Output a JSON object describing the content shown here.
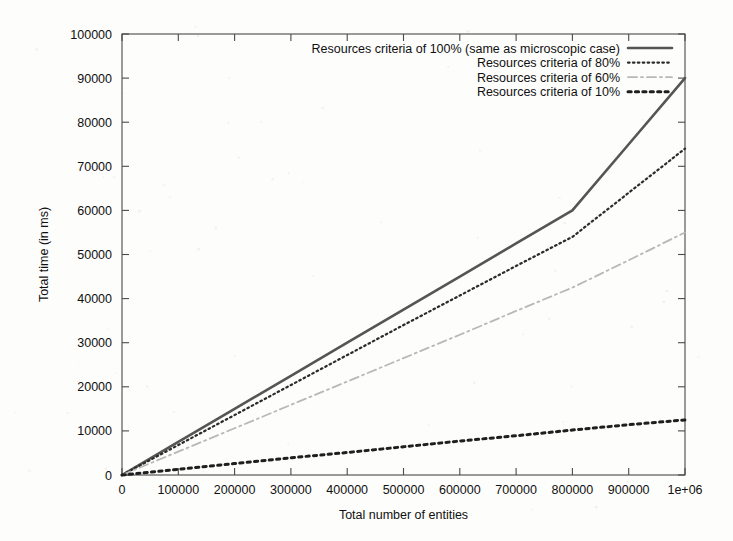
{
  "chart_data": {
    "type": "line",
    "title": "",
    "xlabel": "Total number of entities",
    "ylabel": "Total time (in ms)",
    "xlim": [
      0,
      1000000
    ],
    "ylim": [
      0,
      100000
    ],
    "xticks": [
      0,
      100000,
      200000,
      300000,
      400000,
      500000,
      600000,
      700000,
      800000,
      900000,
      1000000
    ],
    "xtick_labels": [
      "0",
      "100000",
      "200000",
      "300000",
      "400000",
      "500000",
      "600000",
      "700000",
      "800000",
      "900000",
      "1e+06"
    ],
    "yticks": [
      0,
      10000,
      20000,
      30000,
      40000,
      50000,
      60000,
      70000,
      80000,
      90000,
      100000
    ],
    "ytick_labels": [
      "0",
      "10000",
      "20000",
      "30000",
      "40000",
      "50000",
      "60000",
      "70000",
      "80000",
      "90000",
      "100000"
    ],
    "grid": false,
    "legend_position": "top-right",
    "x": [
      0,
      100000,
      200000,
      300000,
      400000,
      500000,
      600000,
      700000,
      800000,
      900000,
      1000000
    ],
    "series": [
      {
        "name": "Resources criteria of 100% (same as microscopic case)",
        "style": "solid",
        "color": "#555555",
        "width": 2.6,
        "values": [
          0,
          7500,
          15000,
          22500,
          30000,
          37500,
          45000,
          52500,
          60000,
          75000,
          90000
        ]
      },
      {
        "name": "Resources criteria of 80%",
        "style": "dotted-fine",
        "color": "#2b2b2b",
        "width": 2.2,
        "values": [
          0,
          6800,
          13600,
          20400,
          27200,
          34000,
          40700,
          47400,
          54000,
          64000,
          74000
        ]
      },
      {
        "name": "Resources criteria of 60%",
        "style": "dash-dot",
        "color": "#b8b8b8",
        "width": 1.8,
        "values": [
          0,
          5300,
          10600,
          15900,
          21200,
          26500,
          31800,
          37200,
          42500,
          48700,
          55000
        ]
      },
      {
        "name": "Resources criteria of 10%",
        "style": "dotted-thick",
        "color": "#1f1f1f",
        "width": 3.0,
        "values": [
          0,
          1300,
          2600,
          3900,
          5100,
          6400,
          7700,
          8900,
          10200,
          11400,
          12500
        ]
      }
    ]
  },
  "legend": {
    "entries": [
      {
        "label": "Resources criteria of 100% (same as microscopic case)"
      },
      {
        "label": "Resources criteria of 80%"
      },
      {
        "label": "Resources criteria of 60%"
      },
      {
        "label": "Resources criteria of 10%"
      }
    ]
  },
  "axes": {
    "x_title": "Total number of entities",
    "y_title": "Total time (in ms)"
  }
}
